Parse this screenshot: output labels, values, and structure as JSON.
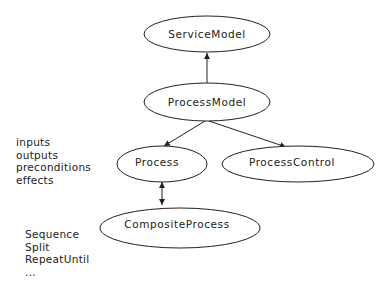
{
  "diagram": {
    "nodes": [
      {
        "id": "service_model",
        "label": "ServiceModel"
      },
      {
        "id": "process_model",
        "label": "ProcessModel"
      },
      {
        "id": "process",
        "label": "Process"
      },
      {
        "id": "process_control",
        "label": "ProcessControl"
      },
      {
        "id": "composite_process",
        "label": "CompositeProcess"
      }
    ],
    "edges": [
      {
        "from": "process_model",
        "to": "service_model",
        "arrow": "single"
      },
      {
        "from": "process_model",
        "to": "process",
        "arrow": "single"
      },
      {
        "from": "process_model",
        "to": "process_control",
        "arrow": "single"
      },
      {
        "from": "process",
        "to": "composite_process",
        "arrow": "double"
      }
    ],
    "process_attributes": [
      "inputs",
      "outputs",
      "preconditions",
      "effects"
    ],
    "composite_constructs": [
      "Sequence",
      "Split",
      "RepeatUntil",
      "..."
    ]
  },
  "colors": {
    "stroke": "#222222",
    "text": "#222222",
    "background": "#ffffff"
  }
}
